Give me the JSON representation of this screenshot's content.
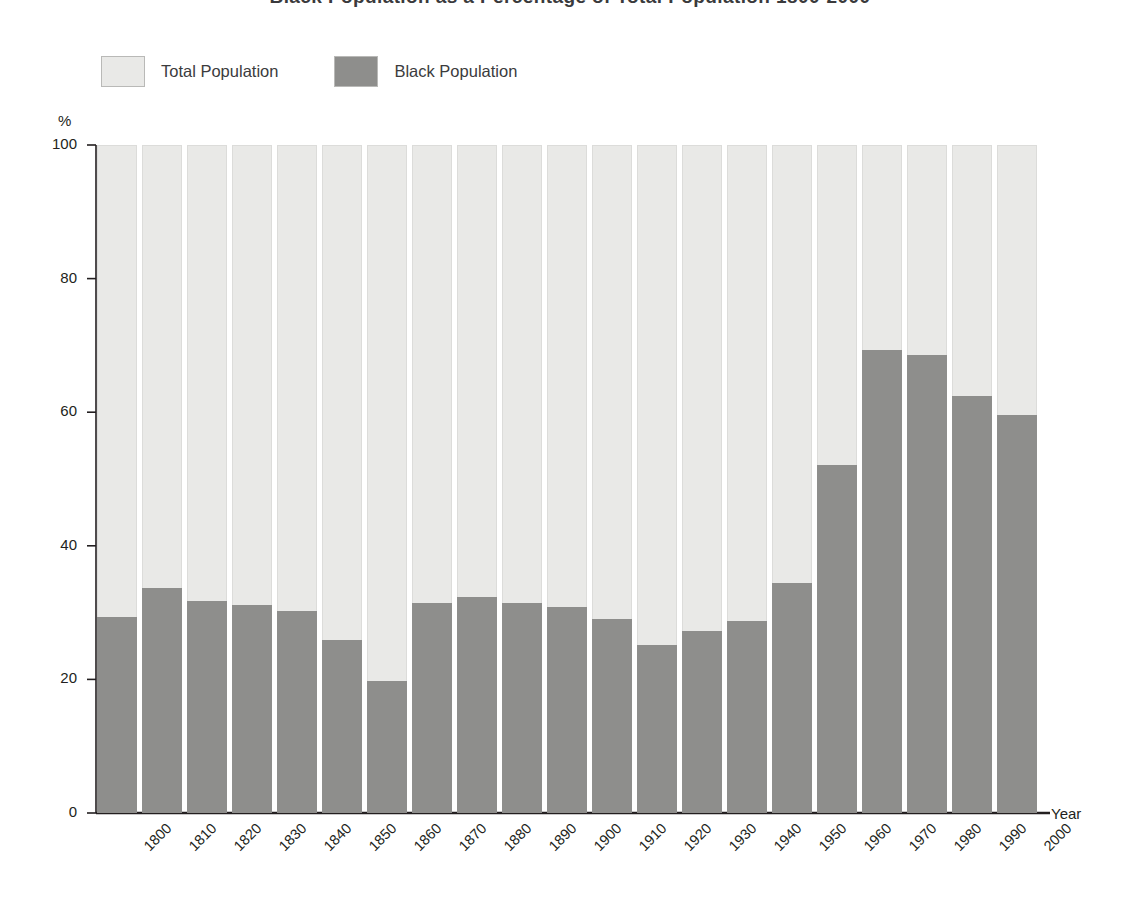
{
  "chart_title": "Black Population as a Percentage of Total Population 1800-2000",
  "legend": {
    "items": [
      {
        "label": "Total Population",
        "color": "#e9e9e7",
        "name": "total-population"
      },
      {
        "label": "Black Population",
        "color": "#8e8e8c",
        "name": "black-population"
      }
    ]
  },
  "axes": {
    "y_unit": "%",
    "x_title": "Year",
    "y_ticks": [
      "0",
      "20",
      "40",
      "60",
      "80",
      "100"
    ]
  },
  "chart_data": {
    "type": "bar",
    "title": "Black Population as a Percentage of Total Population 1800-2000",
    "subtitle": "",
    "xlabel": "Year",
    "ylabel": "%",
    "ylim": [
      0,
      100
    ],
    "grid": false,
    "legend_position": "top-left",
    "stacked": true,
    "categories": [
      "1800",
      "1810",
      "1820",
      "1830",
      "1840",
      "1850",
      "1860",
      "1870",
      "1880",
      "1890",
      "1900",
      "1910",
      "1920",
      "1930",
      "1940",
      "1950",
      "1960",
      "1970",
      "1980",
      "1990",
      "2000"
    ],
    "series": [
      {
        "name": "Total Population",
        "color": "#e9e9e7",
        "values": [
          100,
          100,
          100,
          100,
          100,
          100,
          100,
          100,
          100,
          100,
          100,
          100,
          100,
          100,
          100,
          100,
          100,
          100,
          100,
          100,
          100
        ]
      },
      {
        "name": "Black Population",
        "color": "#8e8e8c",
        "values": [
          29.3,
          33.7,
          31.8,
          31.1,
          30.3,
          25.9,
          19.7,
          31.4,
          32.3,
          31.4,
          30.9,
          29.1,
          25.1,
          27.3,
          28.7,
          34.5,
          52.1,
          69.3,
          68.6,
          62.4,
          59.6
        ]
      }
    ]
  },
  "geometry": {
    "plot_left": 97,
    "plot_right": 1042,
    "baseline_y": 813,
    "top_y": 145,
    "bar_width": 40,
    "bar_pitch": 45.0
  }
}
